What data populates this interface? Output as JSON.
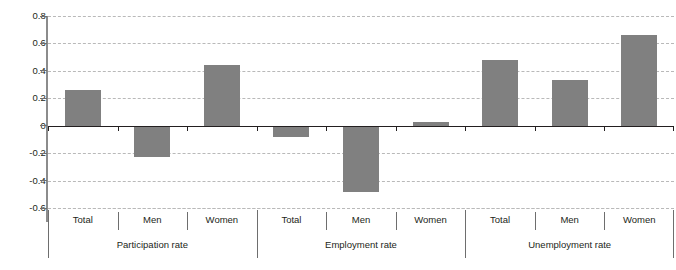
{
  "chart_data": {
    "type": "bar",
    "title": "",
    "subtitle": "",
    "xlabel": "",
    "ylabel": "",
    "ylim": [
      -0.6,
      0.8
    ],
    "yticks": [
      0.8,
      0.6,
      0.4,
      0.2,
      0,
      -0.2,
      -0.4,
      -0.6
    ],
    "ytick_labels": [
      "0.8",
      "0.6",
      "0.4",
      "0.2",
      "0",
      "-0.2",
      "-0.4",
      "-0.6"
    ],
    "grid": true,
    "legend": "none",
    "bar_color": "#808080",
    "zero_line_color": "#231f20",
    "gridline_color": "#b9b9b9",
    "axis_color": "#8c8c8c",
    "groups": [
      {
        "name": "Participation rate",
        "categories": [
          "Total",
          "Men",
          "Women"
        ],
        "values": [
          0.26,
          -0.23,
          0.44
        ]
      },
      {
        "name": "Employment rate",
        "categories": [
          "Total",
          "Men",
          "Women"
        ],
        "values": [
          -0.08,
          -0.48,
          0.03
        ]
      },
      {
        "name": "Unemployment rate",
        "categories": [
          "Total",
          "Men",
          "Women"
        ],
        "values": [
          0.48,
          0.33,
          0.66
        ]
      }
    ],
    "categories": [
      "Total",
      "Men",
      "Women",
      "Total",
      "Men",
      "Women",
      "Total",
      "Men",
      "Women"
    ],
    "values": [
      0.26,
      -0.23,
      0.44,
      -0.08,
      -0.48,
      0.03,
      0.48,
      0.33,
      0.66
    ]
  }
}
